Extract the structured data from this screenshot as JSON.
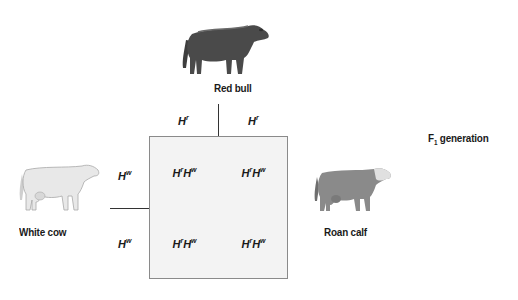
{
  "parents": {
    "bull": {
      "label": "Red bull",
      "icon": "red-bull-image"
    },
    "cow": {
      "label": "White cow",
      "icon": "white-cow-image"
    }
  },
  "offspring": {
    "label": "Roan calf",
    "icon": "roan-calf-image"
  },
  "generation": {
    "label_main": "F",
    "label_sub": "1",
    "label_rest": " generation"
  },
  "punnett": {
    "column_alleles": [
      {
        "base": "H",
        "sup": "r"
      },
      {
        "base": "H",
        "sup": "r"
      }
    ],
    "row_alleles": [
      {
        "base": "H",
        "sup": "w"
      },
      {
        "base": "H",
        "sup": "w"
      }
    ],
    "cells": [
      [
        {
          "a": "H",
          "as": "r",
          "b": "H",
          "bs": "w"
        },
        {
          "a": "H",
          "as": "r",
          "b": "H",
          "bs": "w"
        }
      ],
      [
        {
          "a": "H",
          "as": "r",
          "b": "H",
          "bs": "w"
        },
        {
          "a": "H",
          "as": "r",
          "b": "H",
          "bs": "w"
        }
      ]
    ]
  },
  "colors": {
    "bull": "#4a4a4a",
    "cow": "#e6e6e6",
    "calf": "#8a8a8a",
    "grid_fill": "#f3f3f3"
  }
}
